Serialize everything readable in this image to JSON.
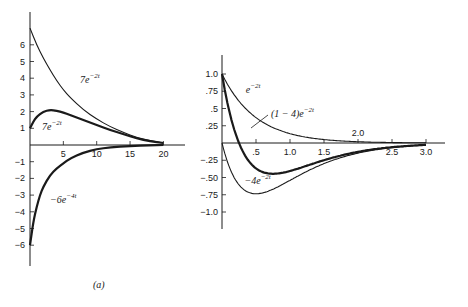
{
  "caption": "(a)",
  "chart_data": [
    {
      "type": "line",
      "title": "",
      "xlabel": "",
      "ylabel": "",
      "xlim": [
        0,
        22
      ],
      "ylim": [
        -7,
        7.5
      ],
      "x_ticks": [
        5,
        10,
        15,
        20
      ],
      "y_ticks": [
        6,
        5,
        4,
        3,
        2,
        1,
        -1,
        -2,
        -3,
        -4,
        -5,
        -6
      ],
      "grid": false,
      "series": [
        {
          "name": "7e^{-2t} (upper)",
          "style": "thin",
          "x": [
            0,
            1,
            2,
            3,
            4,
            5,
            6,
            8,
            10,
            12,
            14,
            16,
            18,
            20
          ],
          "values": [
            7.0,
            6.0,
            5.2,
            4.5,
            3.85,
            3.3,
            2.85,
            2.1,
            1.55,
            1.1,
            0.75,
            0.45,
            0.25,
            0.12
          ]
        },
        {
          "name": "7e^{-2t} (lower, thick)",
          "style": "thick",
          "x": [
            0,
            0.5,
            1,
            2,
            3,
            4,
            5,
            6,
            8,
            10,
            12,
            14,
            16,
            18,
            20
          ],
          "values": [
            1.0,
            1.4,
            1.7,
            2.0,
            2.1,
            2.05,
            1.95,
            1.8,
            1.5,
            1.2,
            0.9,
            0.65,
            0.4,
            0.22,
            0.12
          ]
        },
        {
          "name": "-6e^{-4t}",
          "style": "thick",
          "x": [
            0,
            0.5,
            1,
            1.5,
            2,
            3,
            4,
            5,
            6,
            8,
            10,
            12,
            15,
            18,
            20
          ],
          "values": [
            -6.0,
            -4.6,
            -3.7,
            -3.0,
            -2.5,
            -1.8,
            -1.4,
            -1.1,
            -0.8,
            -0.45,
            -0.25,
            -0.14,
            -0.06,
            -0.02,
            0.0
          ]
        }
      ],
      "annotations": [
        {
          "text": "7e",
          "sup": "−2t",
          "x": 7.5,
          "y": 3.7
        },
        {
          "text": "7e",
          "sup": "−2t",
          "x": 1.8,
          "y": 0.9
        },
        {
          "text": "−6e",
          "sup": "−4t",
          "x": 3.0,
          "y": -3.5
        }
      ]
    },
    {
      "type": "line",
      "title": "",
      "xlabel": "",
      "ylabel": "",
      "xlim": [
        0,
        3.2
      ],
      "ylim": [
        -1.25,
        1.25
      ],
      "x_ticks": [
        0.5,
        1.0,
        1.5,
        2.0,
        2.5,
        3.0
      ],
      "x_tick_labels": [
        ".5",
        "1.0",
        "1.5",
        "2.0",
        "2.5",
        "3.0"
      ],
      "y_ticks": [
        1.0,
        0.75,
        0.5,
        0.25,
        -0.25,
        -0.5,
        -0.75,
        -1.0
      ],
      "y_tick_labels": [
        "1.0",
        ".75",
        ".5",
        ".25",
        "−.25",
        "−.50",
        "−.75",
        "−1.0"
      ],
      "grid": false,
      "series": [
        {
          "name": "e^{-2t}",
          "style": "thin",
          "fn": "exp(-2t)"
        },
        {
          "name": "(1-4t)e^{-2t}",
          "style": "thick",
          "fn": "(1-4t)exp(-2t)"
        },
        {
          "name": "-4te^{-2t}",
          "style": "thin",
          "fn": "-4t exp(-2t)"
        }
      ],
      "annotations": [
        {
          "text": "e",
          "sup": "−2t",
          "x": 0.35,
          "y": 0.72
        },
        {
          "text": "(1 − 4)e",
          "sup": "−2t",
          "x": 0.72,
          "y": 0.38
        },
        {
          "text": "−4e",
          "sup": "−2t",
          "x": 0.33,
          "y": -0.6
        }
      ]
    }
  ]
}
